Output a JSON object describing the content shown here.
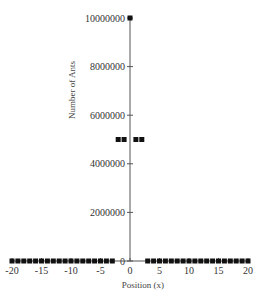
{
  "chart_data": {
    "type": "scatter",
    "title": "",
    "xlabel": "Position (x)",
    "ylabel": "Number of Ants",
    "xlim": [
      -20,
      20
    ],
    "ylim": [
      0,
      10000000
    ],
    "grid": false,
    "legend": null,
    "x_ticks": [
      -20,
      -15,
      -10,
      -5,
      0,
      5,
      10,
      15,
      20
    ],
    "y_ticks": [
      0,
      2000000,
      4000000,
      6000000,
      8000000,
      10000000
    ],
    "x_tick_labels": [
      "-20",
      "-15",
      "-10",
      "-5",
      "0",
      "5",
      "10",
      "15",
      "20"
    ],
    "y_tick_labels": [
      "0",
      "2000000",
      "4000000",
      "6000000",
      "8000000",
      "10000000"
    ],
    "series": [
      {
        "name": "Ants",
        "marker": "square",
        "color": "#111111",
        "x": [
          -20,
          -19,
          -18,
          -17,
          -16,
          -15,
          -14,
          -13,
          -12,
          -11,
          -10,
          -9,
          -8,
          -7,
          -6,
          -5,
          -4,
          -3,
          -2,
          -1,
          0,
          1,
          2,
          3,
          4,
          5,
          6,
          7,
          8,
          9,
          10,
          11,
          12,
          13,
          14,
          15,
          16,
          17,
          18,
          19,
          20
        ],
        "y": [
          0,
          0,
          0,
          0,
          0,
          0,
          0,
          0,
          0,
          0,
          0,
          0,
          0,
          0,
          0,
          0,
          0,
          0,
          5000000,
          5000000,
          10000000,
          5000000,
          5000000,
          0,
          0,
          0,
          0,
          0,
          0,
          0,
          0,
          0,
          0,
          0,
          0,
          0,
          0,
          0,
          0,
          0,
          0
        ]
      }
    ]
  }
}
